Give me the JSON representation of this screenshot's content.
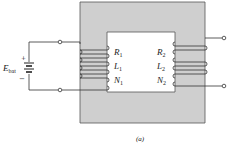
{
  "diagram": {
    "caption": "(a)",
    "battery": {
      "label": "E",
      "subscript": "bat",
      "plus": "+",
      "minus": "−"
    },
    "primary": {
      "R": {
        "label": "R",
        "sub": "1"
      },
      "L": {
        "label": "L",
        "sub": "1"
      },
      "N": {
        "label": "N",
        "sub": "1"
      }
    },
    "secondary": {
      "R": {
        "label": "R",
        "sub": "2"
      },
      "L": {
        "label": "L",
        "sub": "2"
      },
      "N": {
        "label": "N",
        "sub": "2"
      }
    },
    "colors": {
      "core": "#cfcfcf",
      "core_border": "#555555",
      "wire": "#333333",
      "window": "#ffffff"
    }
  }
}
